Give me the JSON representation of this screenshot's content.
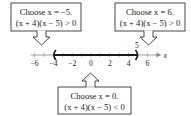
{
  "diagram": {
    "type": "number-line",
    "axis": {
      "variable": "x",
      "min": -6,
      "max": 6,
      "tick_labels": [
        "−6",
        "−4",
        "−2",
        "0",
        "2",
        "4",
        "6"
      ],
      "tick_values": [
        -6,
        -4,
        -2,
        0,
        2,
        4,
        6
      ],
      "minor_step": 1
    },
    "interval": {
      "left": -4,
      "right": 5,
      "left_bracket": "(",
      "right_bracket": ")",
      "endpoint_label": "5"
    },
    "callouts": [
      {
        "id": "left",
        "line1": "Choose x = −5.",
        "line2": "(x + 4)(x − 5) > 0",
        "points_to": -5,
        "position": "top-left"
      },
      {
        "id": "right",
        "line1": "Choose x = 6.",
        "line2": "(x + 4)(x − 5) > 0",
        "points_to": 6,
        "position": "top-right"
      },
      {
        "id": "middle",
        "line1": "Choose x = 0.",
        "line2": "(x + 4)(x − 5) < 0",
        "points_to": 0,
        "position": "bottom-center"
      }
    ],
    "colors": {
      "ink": "#1a1a1a",
      "faint": "#888888"
    }
  }
}
